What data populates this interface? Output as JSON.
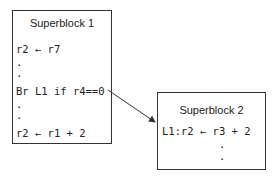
{
  "superblock1": {
    "title": "Superblock 1",
    "lines": [
      "r2 ← r7",
      ".",
      ".",
      "Br L1 if r4==0",
      ".",
      ".",
      "r2 ← r1 + 2"
    ]
  },
  "superblock2": {
    "title": "Superblock 2",
    "lines": [
      "L1:r2 ← r3 + 2",
      "         .",
      "         ."
    ]
  },
  "edge": {
    "from": "Br L1 if r4==0",
    "to": "L1:r2 ← r3 + 2",
    "color": "#333333"
  }
}
